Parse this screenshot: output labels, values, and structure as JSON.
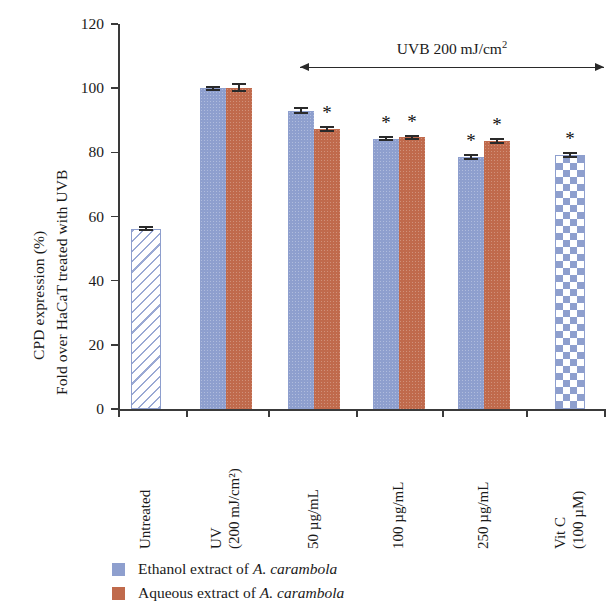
{
  "chart_data": {
    "type": "bar",
    "title": "",
    "xlabel": "",
    "ylabel_line1": "CPD expression (%)",
    "ylabel_line2": "Fold over HaCaT treated with UVB",
    "ylim": [
      0,
      120
    ],
    "yticks": [
      0,
      20,
      40,
      60,
      80,
      100,
      120
    ],
    "ytick_labels": [
      "0",
      "20",
      "40",
      "60",
      "80",
      "100",
      "120"
    ],
    "grid": false,
    "legend_position": "bottom-left",
    "categories": [
      "Untreated",
      "UV (200 mJ/cm2)",
      "50 ug/mL",
      "100 ug/mL",
      "250 ug/mL",
      "Vit C (100 uM)"
    ],
    "category_labels": [
      {
        "line1": "Untreated",
        "line2": ""
      },
      {
        "line1": "UV",
        "line2": "(200 mJ/cm²)"
      },
      {
        "line1": "50 µg/mL",
        "line2": ""
      },
      {
        "line1": "100 µg/mL",
        "line2": ""
      },
      {
        "line1": "250 µg/mL",
        "line2": ""
      },
      {
        "line1": "Vit C",
        "line2": "(100 µM)"
      }
    ],
    "series": [
      {
        "name": "Ethanol extract of A. carambola",
        "color": "#8e9fce",
        "values": [
          null,
          100.0,
          93.0,
          84.3,
          78.6,
          null
        ],
        "errors": [
          null,
          0.5,
          0.7,
          0.6,
          0.6,
          null
        ],
        "significance": [
          null,
          null,
          null,
          "*",
          "*",
          null
        ]
      },
      {
        "name": "Aqueous extract of A. carambola",
        "color": "#c06a4c",
        "values": [
          null,
          100.2,
          87.2,
          84.7,
          83.6,
          null
        ],
        "errors": [
          null,
          1.0,
          0.6,
          0.5,
          0.7,
          null
        ],
        "significance": [
          null,
          null,
          "*",
          "*",
          "*",
          null
        ]
      },
      {
        "name": "Untreated control",
        "color": "#ffffff",
        "pattern": "diagonal-hatch",
        "values": [
          56.2,
          null,
          null,
          null,
          null,
          null
        ],
        "errors": [
          0.4,
          null,
          null,
          null,
          null,
          null
        ],
        "significance": [
          null,
          null,
          null,
          null,
          null,
          null
        ]
      },
      {
        "name": "Vitamin C control",
        "color": "#ffffff",
        "pattern": "checkerboard",
        "values": [
          null,
          null,
          null,
          null,
          null,
          79.2
        ],
        "errors": [
          null,
          null,
          null,
          null,
          null,
          0.6
        ],
        "significance": [
          null,
          null,
          null,
          null,
          null,
          "*"
        ]
      }
    ],
    "annotations": [
      {
        "name": "uvb-range",
        "text": "UVB 200 mJ/cm²",
        "text_main": "UVB 200 mJ/cm",
        "text_sup": "2",
        "type": "double-arrow",
        "spans_categories": [
          "UV (200 mJ/cm2)",
          "Vit C (100 uM)"
        ]
      }
    ],
    "significance_marker": "*"
  },
  "legend": {
    "items": [
      {
        "swatch_color": "#8e9fce",
        "text_prefix": "Ethanol extract of ",
        "species": "A. carambola"
      },
      {
        "swatch_color": "#c06a4c",
        "text_prefix": "Aqueous extract of ",
        "species": "A. carambola"
      }
    ]
  }
}
